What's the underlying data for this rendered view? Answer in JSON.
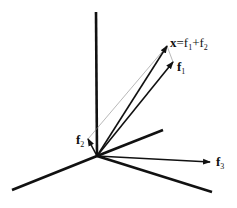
{
  "diagram": {
    "type": "vector-sum-3d",
    "colors": {
      "ink": "#111111",
      "thin": "#888888",
      "background": "#ffffff"
    },
    "origin": [
      97,
      156
    ],
    "axes": [
      {
        "name": "vertical",
        "end": [
          96,
          12
        ]
      },
      {
        "name": "upper-right",
        "end": [
          163,
          130
        ]
      },
      {
        "name": "lower-right",
        "end": [
          212,
          192
        ]
      },
      {
        "name": "lower-left",
        "end": [
          12,
          190
        ]
      }
    ],
    "vectors": [
      {
        "name": "x",
        "end": [
          167,
          46
        ]
      },
      {
        "name": "f1",
        "end": [
          173,
          62
        ]
      },
      {
        "name": "f2",
        "end": [
          88,
          139
        ]
      },
      {
        "name": "f3",
        "end": [
          210,
          162
        ]
      }
    ],
    "labels": {
      "x_sum": {
        "bold_part": "x",
        "rest": "=f",
        "sub1": "1",
        "plus": "+f",
        "sub2": "2"
      },
      "f1": {
        "base": "f",
        "sub": "1"
      },
      "f2": {
        "base": "f",
        "sub": "2"
      },
      "f3": {
        "base": "f",
        "sub": "3"
      }
    }
  }
}
